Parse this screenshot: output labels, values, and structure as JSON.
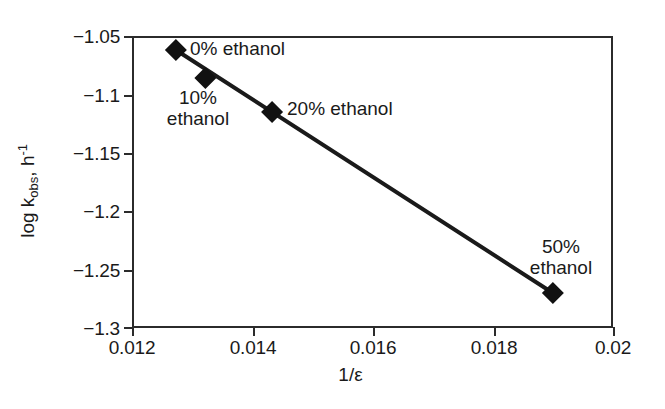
{
  "figure": {
    "background_color": "#ffffff",
    "foreground_color": "#1a1a1a",
    "axis_color": "#2b2b2b"
  },
  "axes": {
    "x_title": "1/ε",
    "y_title_prefix": "log k",
    "y_title_sub": "obs",
    "y_title_mid": ", h",
    "y_title_sup": "-1"
  },
  "chart_data": {
    "type": "scatter",
    "title": "",
    "subtitle": "",
    "xlabel": "1/ε",
    "ylabel": "log k_obs, h^-1",
    "xlim": [
      0.012,
      0.02
    ],
    "ylim": [
      -1.3,
      -1.05
    ],
    "xticks": [
      0.012,
      0.014,
      0.016,
      0.018,
      0.02
    ],
    "xtick_labels": [
      "0.012",
      "0.014",
      "0.016",
      "0.018",
      "0.02"
    ],
    "yticks": [
      -1.05,
      -1.1,
      -1.15,
      -1.2,
      -1.25,
      -1.3
    ],
    "ytick_labels": [
      "−1.05",
      "−1.1",
      "−1.15",
      "−1.2",
      "−1.25",
      "−1.3"
    ],
    "grid": false,
    "legend": false,
    "legend_position": "none",
    "marker": "diamond",
    "marker_color": "#111111",
    "line_color": "#1a1a1a",
    "series": [
      {
        "name": "log k_obs vs 1/ε",
        "x": [
          0.01273,
          0.01322,
          0.01433,
          0.019
        ],
        "y": [
          -1.062,
          -1.086,
          -1.115,
          -1.27
        ],
        "point_labels": [
          "0% ethanol",
          "10%\nethanol",
          "20% ethanol",
          "50%\nethanol"
        ]
      }
    ],
    "trendline": {
      "from": [
        0.01273,
        -1.062
      ],
      "to": [
        0.019,
        -1.27
      ]
    },
    "annotations": [
      {
        "name": "label-0-percent",
        "text": "0% ethanol",
        "align": "left",
        "x_px": 190,
        "y_px": 38
      },
      {
        "name": "label-10-percent",
        "text": "10%\nethanol",
        "align": "center",
        "x_px": 198,
        "y_px": 87
      },
      {
        "name": "label-20-percent",
        "text": "20% ethanol",
        "align": "left",
        "x_px": 287,
        "y_px": 98
      },
      {
        "name": "label-50-percent",
        "text": "50%\nethanol",
        "align": "center",
        "x_px": 561,
        "y_px": 236
      }
    ]
  }
}
